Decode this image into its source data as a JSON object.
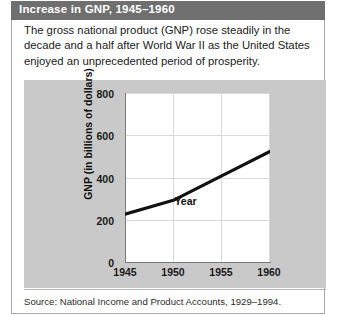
{
  "figure": {
    "header_title": "Increase in GNP, 1945–1960",
    "caption": "The gross national product (GNP) rose steadily in the decade and a half after World War II as the United States enjoyed an unprecedented period of prosperity.",
    "source": "Source: National Income and Product Accounts, 1929–1994."
  },
  "colors": {
    "header_bar": "#6f6f6f",
    "header_text": "#ffffff",
    "chart_panel": "#c9c9c9",
    "plot_background": "#ffffff",
    "line": "#111111",
    "gridline": "#d9d9d9",
    "axis": "#7a7a7a",
    "figure_border": "#a8a8a8"
  },
  "chart_data": {
    "type": "line",
    "title": "Increase in GNP, 1945–1960",
    "xlabel": "Year",
    "ylabel": "GNP (in billions of dollars)",
    "x": [
      1945,
      1950,
      1955,
      1960
    ],
    "values": [
      230,
      295,
      410,
      525
    ],
    "series": [
      {
        "name": "GNP (in billions of dollars)",
        "values": [
          230,
          295,
          410,
          525
        ]
      }
    ],
    "xlim": [
      1945,
      1960
    ],
    "ylim": [
      0,
      800
    ],
    "xticks": [
      1945,
      1950,
      1955,
      1960
    ],
    "yticks": [
      0,
      200,
      400,
      600,
      800
    ],
    "xtick_labels": [
      "1945",
      "1950",
      "1955",
      "1960"
    ],
    "ytick_labels": [
      "0",
      "200",
      "400",
      "600",
      "800"
    ],
    "grid": true,
    "legend": false,
    "annotations": []
  }
}
